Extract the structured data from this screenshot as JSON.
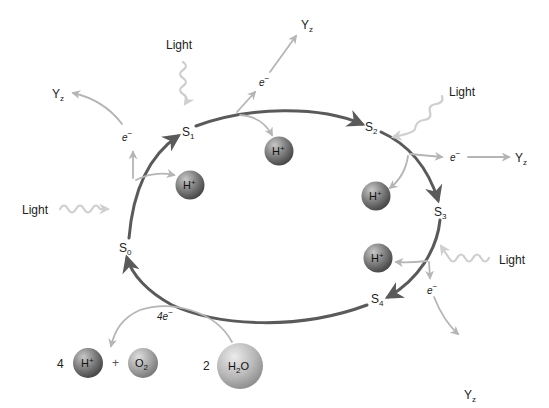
{
  "colors": {
    "cycle_arrow": "#5a5a5a",
    "side_arrow": "#b5b5b5",
    "light_wave": "#cfcfcf",
    "proton_ball": "#7a7a7a",
    "oxygen_ball": "#a8a8a8",
    "water_ball": "#b8b8b8",
    "text": "#222222"
  },
  "states": [
    {
      "id": "S0",
      "base": "S",
      "sub": "0"
    },
    {
      "id": "S1",
      "base": "S",
      "sub": "1"
    },
    {
      "id": "S2",
      "base": "S",
      "sub": "2"
    },
    {
      "id": "S3",
      "base": "S",
      "sub": "3"
    },
    {
      "id": "S4",
      "base": "S",
      "sub": "4"
    }
  ],
  "light_labels": [
    "Light",
    "Light",
    "Light",
    "Light"
  ],
  "electron": {
    "base": "e",
    "sup": "−"
  },
  "acceptor": {
    "base": "Y",
    "sub": "z"
  },
  "proton": {
    "base": "H",
    "sup": "+"
  },
  "products": {
    "proton_coeff": "4",
    "plus": "+",
    "oxygen": {
      "base": "O",
      "sub": "2"
    },
    "electrons_released": "4e",
    "electrons_sup": "−"
  },
  "reactant": {
    "coeff": "2",
    "water": {
      "base": "H",
      "sub": "2",
      "tail": "O"
    }
  }
}
